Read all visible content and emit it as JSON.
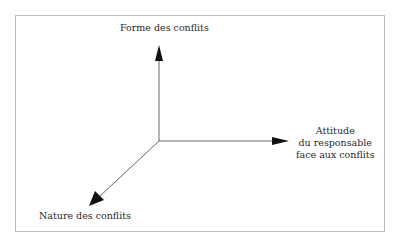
{
  "diagram": {
    "type": "3-axis diagram",
    "axes": {
      "vertical": {
        "label": "Forme des conflits"
      },
      "horizontal": {
        "label_lines": [
          "Attitude",
          "du responsable",
          "face aux conflits"
        ]
      },
      "diagonal": {
        "label": "Nature des conflits"
      }
    },
    "colors": {
      "line": "#555555",
      "arrowhead": "#111111",
      "frame": "#bdbdbd",
      "text": "#2a2a2a"
    }
  }
}
